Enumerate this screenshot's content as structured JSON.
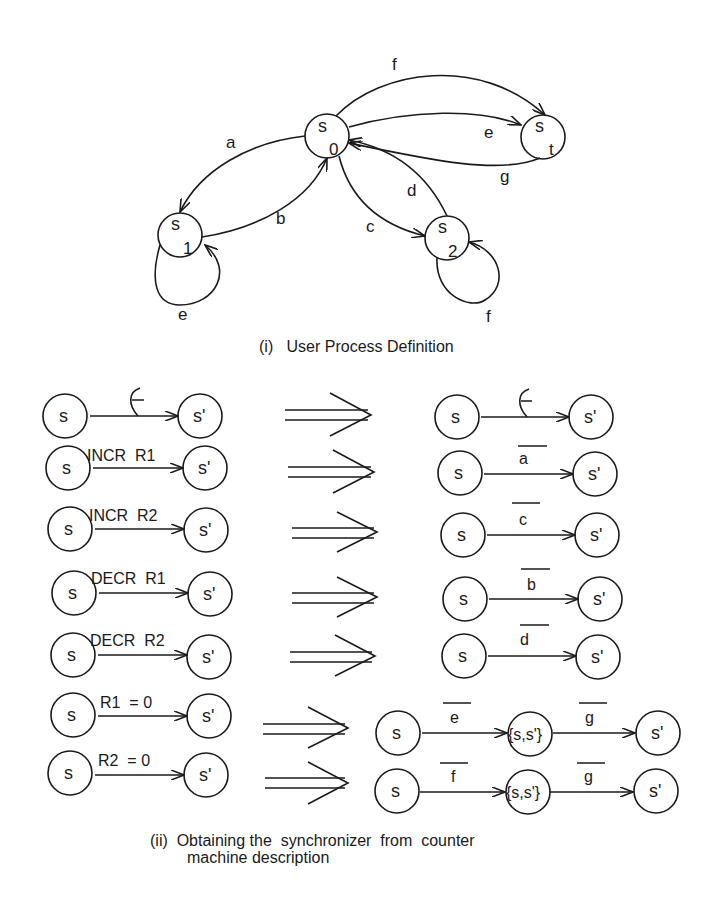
{
  "figure": {
    "part_i": {
      "caption": "(i)   User Process Definition",
      "states": [
        {
          "id": "s0",
          "label": "s",
          "subscript": "0"
        },
        {
          "id": "s1",
          "label": "s",
          "subscript": "1"
        },
        {
          "id": "s2",
          "label": "s",
          "subscript": "2"
        },
        {
          "id": "st",
          "label": "s",
          "subscript": "t"
        }
      ],
      "transitions": [
        {
          "from": "s0",
          "to": "s1",
          "label": "a"
        },
        {
          "from": "s1",
          "to": "s0",
          "label": "b"
        },
        {
          "from": "s0",
          "to": "s2",
          "label": "c"
        },
        {
          "from": "s2",
          "to": "s0",
          "label": "d"
        },
        {
          "from": "s0",
          "to": "st",
          "label": "e"
        },
        {
          "from": "s0",
          "to": "st",
          "label": "f"
        },
        {
          "from": "st",
          "to": "s0",
          "label": "g"
        },
        {
          "from": "s1",
          "to": "s1",
          "label": "e"
        },
        {
          "from": "s2",
          "to": "s2",
          "label": "f"
        }
      ]
    },
    "part_ii": {
      "caption_line1": "(ii)  Obtaining the  synchronizer  from  counter",
      "caption_line2": "machine description",
      "state_s": "s",
      "state_sp": "s'",
      "state_pair": "{s,s'}",
      "rules": [
        {
          "counter_label": "ε",
          "sync_labels": [
            "ε"
          ]
        },
        {
          "counter_label": "INCR  R1",
          "sync_labels": [
            "a"
          ]
        },
        {
          "counter_label": "INCR  R2",
          "sync_labels": [
            "c"
          ]
        },
        {
          "counter_label": "DECR  R1",
          "sync_labels": [
            "b"
          ]
        },
        {
          "counter_label": "DECR  R2",
          "sync_labels": [
            "d"
          ]
        },
        {
          "counter_label": "R1  = 0",
          "sync_labels": [
            "e",
            "g"
          ]
        },
        {
          "counter_label": "R2  = 0",
          "sync_labels": [
            "f",
            "g"
          ]
        }
      ]
    }
  }
}
